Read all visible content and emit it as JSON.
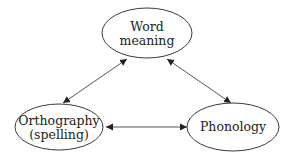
{
  "diagram": {
    "type": "triangle-relationship",
    "colors": {
      "stroke": "#3a3a3a",
      "edge": "#555555",
      "text": "#222222",
      "background": "#ffffff"
    },
    "nodes": [
      {
        "id": "word-meaning",
        "lines": [
          "Word",
          "meaning"
        ],
        "cx": 147,
        "cy": 33,
        "rx": 45,
        "ry": 25
      },
      {
        "id": "orthography",
        "lines": [
          "Orthography",
          "(spelling)"
        ],
        "cx": 59,
        "cy": 127,
        "rx": 44,
        "ry": 23
      },
      {
        "id": "phonology",
        "lines": [
          "Phonology"
        ],
        "cx": 233,
        "cy": 127,
        "rx": 46,
        "ry": 24
      }
    ],
    "edges": [
      {
        "from": "word-meaning",
        "to": "orthography",
        "bidirectional": true
      },
      {
        "from": "word-meaning",
        "to": "phonology",
        "bidirectional": true
      },
      {
        "from": "orthography",
        "to": "phonology",
        "bidirectional": true
      }
    ]
  }
}
